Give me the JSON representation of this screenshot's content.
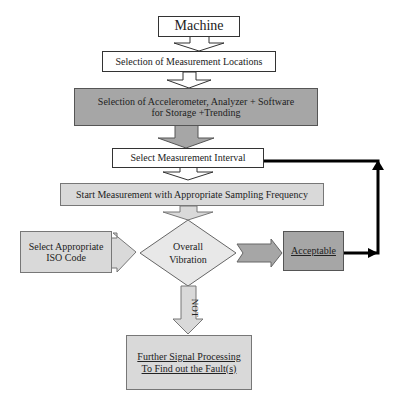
{
  "diagram": {
    "nodes": {
      "machine": "Machine",
      "locations": "Selection of Measurement Locations",
      "equipment_line1": "Selection of Accelerometer, Analyzer + Software",
      "equipment_line2": "for Storage +Trending",
      "interval": "Select Measurement Interval",
      "start": "Start Measurement with Appropriate Sampling Frequency",
      "iso_line1": "Select Appropriate",
      "iso_line2": "ISO Code",
      "decision_line1": "Overall",
      "decision_line2": "Vibration",
      "acceptable": "Acceptable",
      "further_line1": "Further Signal Processing",
      "further_line2": "To Find out the Fault(s)"
    },
    "edge_labels": {
      "not": "NOT"
    },
    "colors": {
      "dark_fill": "#a6a6a6",
      "light_fill": "#d9d9d9",
      "line": "#000000"
    }
  }
}
